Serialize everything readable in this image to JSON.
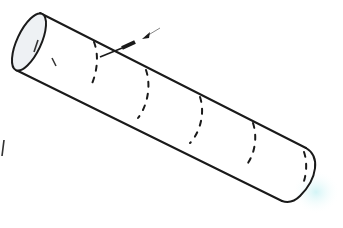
{
  "diagram": {
    "type": "line-drawing",
    "colors": {
      "background": "#ffffff",
      "stroke": "#1a1a1a",
      "end_fill": "#eef1f4",
      "glow": "#bfeff2"
    },
    "tube": {
      "top_edge": {
        "x1": 40,
        "y1": 13,
        "x2": 306,
        "y2": 148
      },
      "bottom_edge": {
        "x1": 16,
        "y1": 70,
        "x2": 282,
        "y2": 201
      },
      "left_end": {
        "cx": 29,
        "cy": 42,
        "rx": 12,
        "ry": 31,
        "rotate": 25
      },
      "right_end_path": "M306,148 C320,156 318,178 300,196 C294,202 288,203 282,201"
    },
    "rings": [
      {
        "path": "M94,42 C100,58 96,76 90,88"
      },
      {
        "path": "M146,70 C152,88 146,108 138,118"
      },
      {
        "path": "M200,97 C206,116 198,135 190,143"
      },
      {
        "path": "M253,123 C259,142 252,160 244,168"
      },
      {
        "path": "M304,152 C308,164 306,178 302,186"
      }
    ],
    "interior_marks": [
      {
        "path": "M38,40 L34,52"
      },
      {
        "path": "M52,58 L56,66"
      }
    ],
    "needle": {
      "shaft": {
        "x1": 100,
        "y1": 57,
        "x2": 132,
        "y2": 44
      },
      "barrel": {
        "x1": 122,
        "y1": 48,
        "x2": 135,
        "y2": 42
      },
      "arrow_tip": {
        "x": 142,
        "y": 39
      },
      "arrow_tail": {
        "x": 160,
        "y": 28
      }
    },
    "stray_marks": [
      {
        "path": "M4,140 L2,156"
      }
    ]
  }
}
